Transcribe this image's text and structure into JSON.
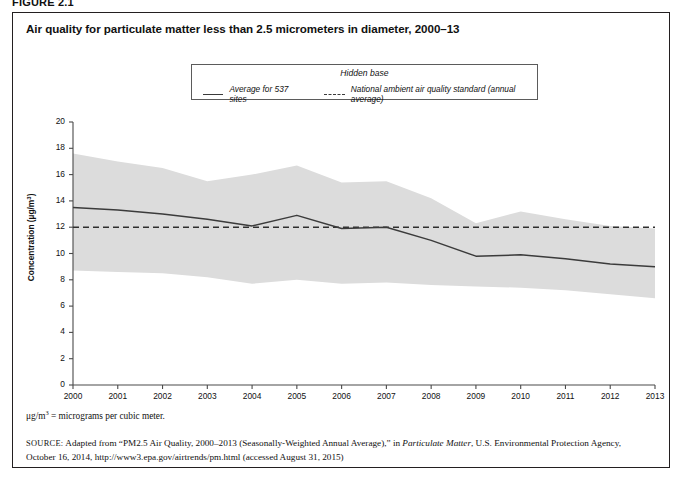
{
  "figure": {
    "label": "FIGURE 2.1",
    "title": "Air quality for particulate matter less than 2.5 micrometers in diameter, 2000–13"
  },
  "legend": {
    "title": "Hidden base",
    "series_label": "Average for 537 sites",
    "standard_label": "National ambient air quality standard (annual average)"
  },
  "notes": {
    "unit_prefix": "μg/m",
    "unit_sup": "3",
    "unit_text": " = micrograms per cubic meter.",
    "source_tag": "SOURCE:",
    "source_part1": " Adapted from “PM2.5 Air Quality, 2000–2013 (Seasonally-Weighted Annual Average),” in ",
    "source_italic": "Particulate Matter",
    "source_part2": ", U.S. Environmental Protection Agency, October 16, 2014, http://www3.epa.gov/airtrends/pm.html (accessed August 31, 2015)"
  },
  "chart_data": {
    "type": "line",
    "title": "Air quality for particulate matter less than 2.5 micrometers in diameter, 2000–13",
    "xlabel": "",
    "ylabel": "Concentration (μg/m3)",
    "ylim": [
      0,
      20
    ],
    "ytick_step": 2,
    "yticks": [
      0,
      2,
      4,
      6,
      8,
      10,
      12,
      14,
      16,
      18,
      20
    ],
    "grid": false,
    "legend_position": "top-center",
    "categories": [
      2000,
      2001,
      2002,
      2003,
      2004,
      2005,
      2006,
      2007,
      2008,
      2009,
      2010,
      2011,
      2012,
      2013
    ],
    "xticks": [
      "2000",
      "2001",
      "2002",
      "2003",
      "2004",
      "2005",
      "2006",
      "2007",
      "2008",
      "2009",
      "2010",
      "2011",
      "2012",
      "2013"
    ],
    "series": [
      {
        "name": "Average for 537 sites",
        "style": "solid",
        "color": "#3b3b3b",
        "values": [
          13.5,
          13.3,
          13.0,
          12.6,
          12.1,
          12.9,
          11.9,
          12.0,
          11.0,
          9.8,
          9.9,
          9.6,
          9.2,
          9.0
        ]
      },
      {
        "name": "National ambient air quality standard (annual average)",
        "style": "dashed",
        "color": "#2f2f2f",
        "constant": 12.0,
        "values": [
          12.0,
          12.0,
          12.0,
          12.0,
          12.0,
          12.0,
          12.0,
          12.0,
          12.0,
          12.0,
          12.0,
          12.0,
          12.0,
          12.0
        ]
      }
    ],
    "band": {
      "name": "Hidden base",
      "color": "#dcdcdc",
      "upper": [
        17.6,
        17.0,
        16.5,
        15.5,
        16.0,
        16.7,
        15.4,
        15.5,
        14.2,
        12.3,
        13.2,
        12.6,
        12.1,
        11.9
      ],
      "lower": [
        8.7,
        8.6,
        8.5,
        8.2,
        7.7,
        8.0,
        7.7,
        7.8,
        7.6,
        7.5,
        7.4,
        7.2,
        6.9,
        6.6
      ]
    }
  }
}
